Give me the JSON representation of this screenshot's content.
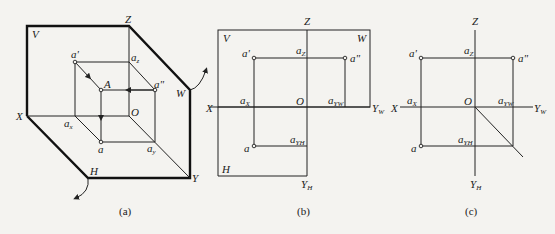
{
  "figure": {
    "panels": [
      {
        "id": "a",
        "caption": "(a)",
        "description": "Point A projected onto three orthogonal projection planes (pictorial view)",
        "labels": {
          "V": "V",
          "W": "W",
          "H": "H",
          "X": "X",
          "Y": "Y",
          "Z": "Z",
          "O": "O",
          "A": "A",
          "a_prime": "a'",
          "a_double_prime": "a\"",
          "a": "a",
          "az": "a",
          "az_sub": "z",
          "ax": "a",
          "ax_sub": "x",
          "ay": "a",
          "ay_sub": "y"
        }
      },
      {
        "id": "b",
        "caption": "(b)",
        "description": "Projection planes unfolded",
        "labels": {
          "V": "V",
          "W": "W",
          "H": "H",
          "X": "X",
          "Z": "Z",
          "O": "O",
          "YW": "Y",
          "YW_sub": "W",
          "YH": "Y",
          "YH_sub": "H",
          "a_prime": "a'",
          "a_double_prime": "a\"",
          "a": "a",
          "aZ": "a",
          "aZ_sub": "Z",
          "aX": "a",
          "aX_sub": "X",
          "aYW": "a",
          "aYW_sub": "YW",
          "aYH": "a",
          "aYH_sub": "YH"
        }
      },
      {
        "id": "c",
        "caption": "(c)",
        "description": "Three-view projection of point with 45° auxiliary line",
        "labels": {
          "X": "X",
          "Z": "Z",
          "O": "O",
          "YW": "Y",
          "YW_sub": "W",
          "YH": "Y",
          "YH_sub": "H",
          "a_prime": "a'",
          "a_double_prime": "a\"",
          "a": "a",
          "aZ": "a",
          "aZ_sub": "Z",
          "aX": "a",
          "aX_sub": "X",
          "aYW": "a",
          "aYW_sub": "YW",
          "aYH": "a",
          "aYH_sub": "YH"
        }
      }
    ]
  }
}
